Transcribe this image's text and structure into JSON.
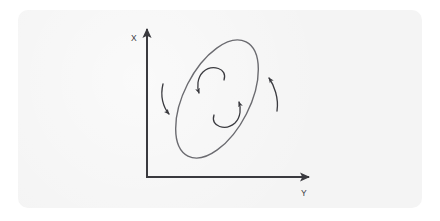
{
  "figure": {
    "title": "",
    "canvas": {
      "width": 440,
      "height": 221,
      "background": "#ffffff"
    },
    "panel": {
      "name": "figure-panel",
      "x": 18,
      "y": 10,
      "width": 404,
      "height": 198,
      "fill": "#f4f4f4",
      "corner_radius": 10
    }
  },
  "colors": {
    "panel_background": "#f4f4f4",
    "page_background": "#ffffff",
    "axis_ink": "#3a3a3f",
    "ellipse_ink": "#6b6b70",
    "arrow_ink": "#3a3a3f",
    "label_ink": "#3a3a3f"
  },
  "axes": {
    "origin": {
      "x": 147,
      "y": 177
    },
    "vertical": {
      "name": "x-axis",
      "label": "X",
      "label_position": {
        "x": 134,
        "y": 39
      },
      "from": {
        "x": 147,
        "y": 177
      },
      "to": {
        "x": 147,
        "y": 27
      },
      "arrowhead": "up",
      "stroke_width": 2.0
    },
    "horizontal": {
      "name": "y-axis",
      "label": "Y",
      "label_position": {
        "x": 304,
        "y": 192
      },
      "from": {
        "x": 147,
        "y": 177
      },
      "to": {
        "x": 311,
        "y": 177
      },
      "arrowhead": "right",
      "stroke_width": 2.0
    }
  },
  "ellipse": {
    "name": "tilted-ellipse",
    "center": {
      "x": 217,
      "y": 99
    },
    "radius_x": 33,
    "radius_y": 64,
    "rotation_deg": 27,
    "stroke": "#6b6b70",
    "stroke_width": 1.4,
    "fill": "none"
  },
  "arrows": {
    "inner": [
      {
        "name": "inner-arrow-upper",
        "description": "curved arrow inside ellipse sweeping over the top and pointing down-left",
        "direction": "counterclockwise",
        "tip": {
          "x": 199,
          "y": 95
        },
        "tail": {
          "x": 222,
          "y": 76
        }
      },
      {
        "name": "inner-arrow-lower",
        "description": "curved arrow inside ellipse sweeping under the bottom and pointing up-right",
        "direction": "counterclockwise",
        "tip": {
          "x": 239,
          "y": 100
        },
        "tail": {
          "x": 216,
          "y": 119
        }
      }
    ],
    "outer": [
      {
        "name": "outer-arrow-left",
        "description": "curved arrow left of the ellipse pointing downward",
        "direction": "downward",
        "tip": {
          "x": 170,
          "y": 117
        },
        "tail": {
          "x": 164,
          "y": 85
        }
      },
      {
        "name": "outer-arrow-right",
        "description": "curved arrow right of the ellipse pointing upward",
        "direction": "upward",
        "tip": {
          "x": 268,
          "y": 75
        },
        "tail": {
          "x": 276,
          "y": 110
        }
      }
    ]
  }
}
